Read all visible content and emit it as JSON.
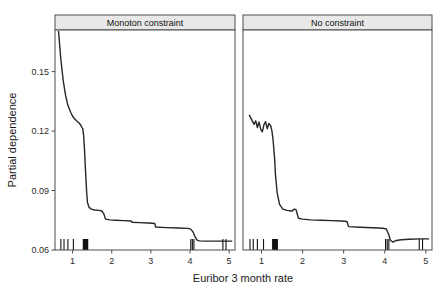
{
  "figure": {
    "width": 448,
    "height": 289,
    "background": "#ffffff",
    "line_color": "#262626",
    "strip_fill": "#e8e8e8",
    "border_color": "#4d4d4d"
  },
  "chart_data": {
    "type": "line",
    "title": "",
    "xlabel": "Euribor 3 month rate",
    "ylabel": "Partial dependence",
    "xlim": [
      0.55,
      5.15
    ],
    "ylim": [
      0.06,
      0.171
    ],
    "xticks": [
      1,
      2,
      3,
      4,
      5
    ],
    "xtick_labels": [
      "1",
      "2",
      "3",
      "4",
      "5"
    ],
    "yticks": [
      0.06,
      0.09,
      0.12,
      0.15
    ],
    "ytick_labels": [
      "0.06",
      "0.09",
      "0.12",
      "0.15"
    ],
    "grid": false,
    "legend": "none",
    "facet_layout": "1x2",
    "panels": [
      {
        "label": "Monoton constraint",
        "series_name": "partial dependence (monotone)",
        "x": [
          0.64,
          0.66,
          0.7,
          0.76,
          0.82,
          0.88,
          0.95,
          1.0,
          1.05,
          1.1,
          1.14,
          1.17,
          1.2,
          1.22,
          1.24,
          1.26,
          1.28,
          1.3,
          1.32,
          1.34,
          1.36,
          1.38,
          1.42,
          1.48,
          1.56,
          1.66,
          1.74,
          1.8,
          1.84,
          1.95,
          2.1,
          2.3,
          2.5,
          2.52,
          2.7,
          2.95,
          3.1,
          3.12,
          3.4,
          3.7,
          3.95,
          4.02,
          4.08,
          4.12,
          4.18,
          4.24,
          4.4,
          4.7,
          5.0,
          5.08
        ],
        "y": [
          0.1705,
          0.1655,
          0.156,
          0.1455,
          0.138,
          0.133,
          0.1295,
          0.1275,
          0.1262,
          0.1252,
          0.1245,
          0.124,
          0.1232,
          0.1225,
          0.1218,
          0.1212,
          0.118,
          0.112,
          0.104,
          0.096,
          0.089,
          0.084,
          0.0815,
          0.0806,
          0.0802,
          0.08,
          0.0798,
          0.0782,
          0.0756,
          0.0752,
          0.075,
          0.0748,
          0.0746,
          0.074,
          0.0738,
          0.0736,
          0.0734,
          0.0716,
          0.0713,
          0.0711,
          0.0709,
          0.0705,
          0.069,
          0.067,
          0.065,
          0.0646,
          0.0645,
          0.0645,
          0.0645,
          0.0645
        ],
        "rug_values": [
          0.7,
          0.78,
          0.88,
          1.02,
          1.28,
          1.31,
          1.34,
          1.37,
          4.02,
          4.06,
          4.1,
          4.84,
          4.92
        ],
        "rug_dense_ranges": [
          [
            1.26,
            1.4
          ]
        ]
      },
      {
        "label": "No constraint",
        "series_name": "partial dependence (unconstrained)",
        "x": [
          0.7,
          0.76,
          0.82,
          0.86,
          0.9,
          0.94,
          0.98,
          1.02,
          1.06,
          1.1,
          1.14,
          1.18,
          1.22,
          1.25,
          1.28,
          1.32,
          1.34,
          1.38,
          1.44,
          1.52,
          1.62,
          1.7,
          1.74,
          1.8,
          1.84,
          1.9,
          2.0,
          2.2,
          2.45,
          2.7,
          2.95,
          3.08,
          3.12,
          3.4,
          3.7,
          3.95,
          4.04,
          4.1,
          4.14,
          4.2,
          4.28,
          4.4,
          4.6,
          4.85,
          5.0,
          5.08
        ],
        "y": [
          0.1282,
          0.1258,
          0.1234,
          0.1252,
          0.1218,
          0.1246,
          0.121,
          0.1196,
          0.1232,
          0.1248,
          0.1212,
          0.1238,
          0.1228,
          0.1206,
          0.116,
          0.106,
          0.098,
          0.089,
          0.083,
          0.0806,
          0.08,
          0.0798,
          0.0796,
          0.0806,
          0.0804,
          0.076,
          0.0756,
          0.0752,
          0.075,
          0.0748,
          0.0746,
          0.0744,
          0.0718,
          0.0715,
          0.0712,
          0.071,
          0.0706,
          0.0676,
          0.0648,
          0.064,
          0.0648,
          0.0652,
          0.0654,
          0.0656,
          0.0656,
          0.0656
        ],
        "rug_values": [
          0.72,
          0.8,
          0.9,
          1.05,
          1.28,
          1.31,
          1.34,
          1.37,
          4.02,
          4.06,
          4.1,
          4.84,
          4.92
        ],
        "rug_dense_ranges": [
          [
            1.26,
            1.4
          ]
        ]
      }
    ]
  }
}
